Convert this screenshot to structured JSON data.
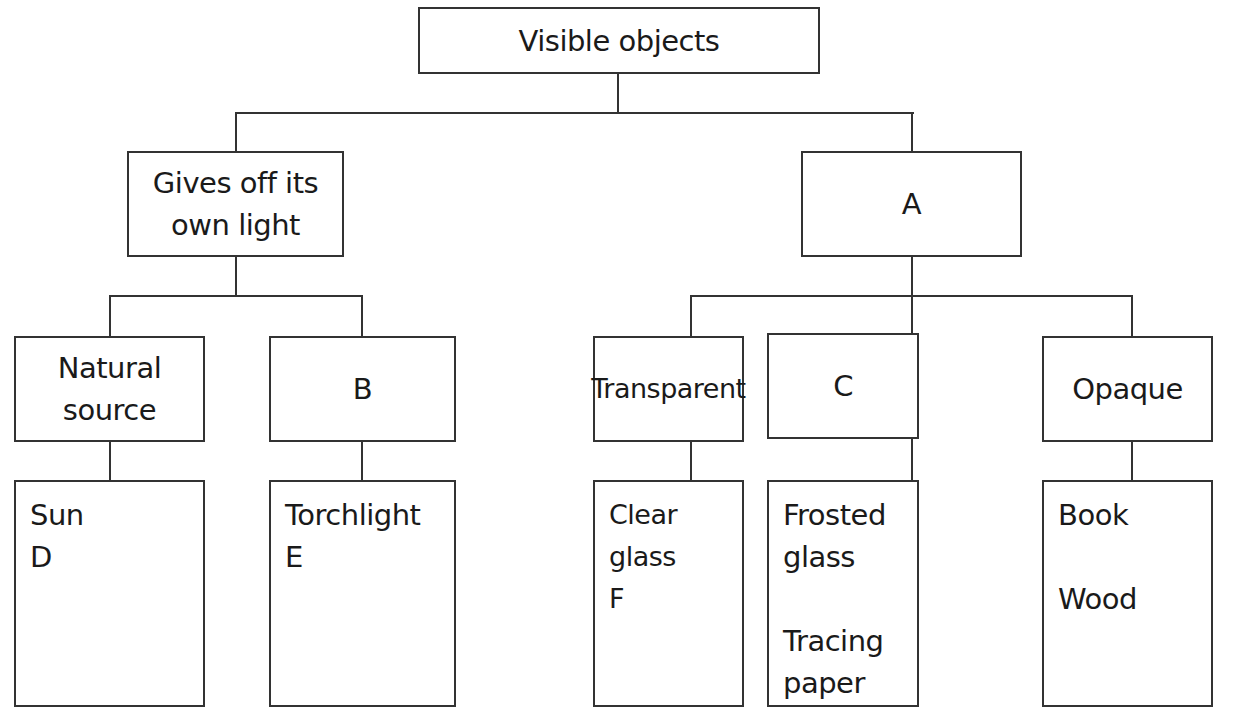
{
  "diagram": {
    "type": "tree",
    "root": {
      "label": "Visible objects"
    },
    "level1": [
      {
        "label": "Gives off its\nown light"
      },
      {
        "label": "A"
      }
    ],
    "level2": [
      {
        "label": "Natural\nsource",
        "parent": "Gives off its own light"
      },
      {
        "label": "B",
        "parent": "Gives off its own light"
      },
      {
        "label": "Transparent",
        "parent": "A"
      },
      {
        "label": "C",
        "parent": "A"
      },
      {
        "label": "Opaque",
        "parent": "A"
      }
    ],
    "leaves": [
      {
        "parent": "Natural source",
        "items": [
          "Sun",
          "D"
        ]
      },
      {
        "parent": "B",
        "items": [
          "Torchlight",
          "E"
        ]
      },
      {
        "parent": "Transparent",
        "items": [
          "Clear glass",
          "F"
        ]
      },
      {
        "parent": "C",
        "items": [
          "Frosted\nglass",
          "Tracing\npaper"
        ]
      },
      {
        "parent": "Opaque",
        "items": [
          "Book",
          "Wood"
        ]
      }
    ]
  }
}
